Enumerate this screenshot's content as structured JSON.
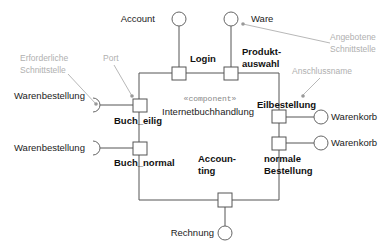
{
  "diagram": {
    "type": "UML component diagram",
    "component": {
      "stereotype": "«component»",
      "name": "Internetbuchhandlung"
    },
    "ports": [
      {
        "id": "login",
        "label": "Login"
      },
      {
        "id": "produktauswahl",
        "label_line1": "Produkt-",
        "label_line2": "auswahl"
      },
      {
        "id": "eilbestellung",
        "label": "Eilbestellung"
      },
      {
        "id": "normale_bestellung",
        "label_line1": "normale",
        "label_line2": "Bestellung"
      },
      {
        "id": "buch_eilig",
        "label": "Buch_eilig"
      },
      {
        "id": "buch_normal",
        "label": "Buch_normal"
      },
      {
        "id": "accounting",
        "label_line1": "Accoun-",
        "label_line2": "ting"
      }
    ],
    "provided_interfaces": [
      {
        "label": "Account"
      },
      {
        "label": "Ware"
      },
      {
        "label": "Warenkorb"
      },
      {
        "label": "Warenkorb"
      },
      {
        "label": "Rechnung"
      }
    ],
    "required_interfaces": [
      {
        "label": "Warenbestellung"
      },
      {
        "label": "Warenbestellung"
      }
    ],
    "annotations": {
      "required_interface_line1": "Erforderliche",
      "required_interface_line2": "Schnittstelle",
      "port": "Port",
      "provided_interface_line1": "Angebotene",
      "provided_interface_line2": "Schnittstelle",
      "port_name": "Anschlussname"
    },
    "colors": {
      "lines": "#555555",
      "annotation_text": "#b0b0b0",
      "background": "#ffffff"
    }
  }
}
